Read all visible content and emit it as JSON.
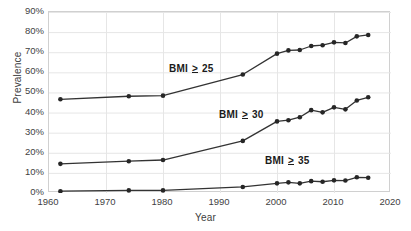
{
  "chart_data": {
    "type": "line",
    "title": "",
    "xlabel": "Year",
    "ylabel": "Prevalence",
    "xlim": [
      1960,
      2020
    ],
    "ylim": [
      0,
      90
    ],
    "grid": true,
    "grid_axis": "both",
    "legend_position": "inline-annotations",
    "xticks": [
      1960,
      1970,
      1980,
      1990,
      2000,
      2010,
      2020
    ],
    "xtick_labels": [
      "1960",
      "1970",
      "1980",
      "1990",
      "2000",
      "2010",
      "2020"
    ],
    "yticks": [
      0,
      10,
      20,
      30,
      40,
      50,
      60,
      70,
      80,
      90
    ],
    "ytick_labels": [
      "0%",
      "10%",
      "20%",
      "30%",
      "40%",
      "50%",
      "60%",
      "70%",
      "80%",
      "90%"
    ],
    "marker": "circle",
    "line_color": "#333333",
    "marker_color": "#262626",
    "series": [
      {
        "name": "BMI ≥ 25",
        "label_prefix": "BMI",
        "label_operator": "≥",
        "label_value": "25",
        "x": [
          1962,
          1974,
          1980,
          1994,
          2000,
          2002,
          2004,
          2006,
          2008,
          2010,
          2012,
          2014,
          2016
        ],
        "values": [
          46.6,
          48.1,
          48.4,
          58.9,
          69.3,
          70.9,
          71.1,
          73.1,
          73.5,
          74.9,
          74.6,
          77.9,
          78.6
        ]
      },
      {
        "name": "BMI ≥ 30",
        "label_prefix": "BMI",
        "label_operator": "≥",
        "label_value": "30",
        "x": [
          1962,
          1974,
          1980,
          1994,
          2000,
          2002,
          2004,
          2006,
          2008,
          2010,
          2012,
          2014,
          2016
        ],
        "values": [
          14.5,
          15.8,
          16.4,
          25.9,
          35.6,
          36.2,
          37.7,
          41.2,
          40.1,
          42.6,
          41.6,
          46.0,
          47.6
        ]
      },
      {
        "name": "BMI ≥ 35",
        "label_prefix": "BMI",
        "label_operator": "≥",
        "label_value": "35",
        "x": [
          1962,
          1974,
          1980,
          1994,
          2000,
          2002,
          2004,
          2006,
          2008,
          2010,
          2012,
          2014,
          2016
        ],
        "values": [
          0.9,
          1.3,
          1.3,
          3.0,
          4.8,
          5.3,
          4.8,
          5.9,
          5.6,
          6.3,
          6.2,
          7.8,
          7.6
        ]
      }
    ],
    "annotations": [
      {
        "text": "BMI ≥ 25",
        "x_px": 169,
        "y_px": 63
      },
      {
        "text": "BMI ≥ 30",
        "x_px": 219,
        "y_px": 109
      },
      {
        "text": "BMI ≥ 35",
        "x_px": 265,
        "y_px": 155
      }
    ]
  }
}
